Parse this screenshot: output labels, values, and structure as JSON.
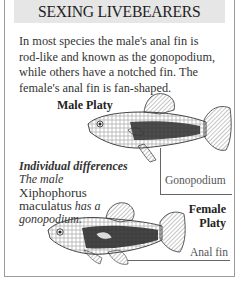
{
  "header": {
    "title": "SEXING LIVEBEARERS"
  },
  "intro": {
    "lines": [
      "In most species the male's anal fin is",
      "rod-like and known as the gonopodium,",
      "while others have a notched fin. The",
      "female's anal fin is fan-shaped."
    ]
  },
  "male": {
    "label": "Male Platy",
    "annotation": "Gonopodium"
  },
  "female": {
    "label_line1": "Female",
    "label_line2": "Platy",
    "annotation": "Anal fin"
  },
  "caption": {
    "heading": "Individual differences",
    "line1": "The male",
    "genus": "Xiphophorus",
    "species": "maculatus",
    "line3_tail": "has a",
    "line4": "gonopodium."
  },
  "colors": {
    "header_bg": "#e6e6e6",
    "border": "#9a9a9a",
    "text": "#333333"
  }
}
